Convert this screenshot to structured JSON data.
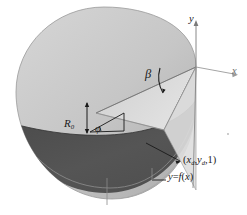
{
  "figure": {
    "background_color": "#ffffff",
    "surface_light_color": "#c9c9c9",
    "surface_mid_color": "#b4b4b4",
    "surface_dark_color": "#4d4d4d",
    "surface_edge_color": "#8a8a8a",
    "line_color": "#1a1a1a",
    "axis_color": "#7a7a7a"
  },
  "labels": {
    "beta": "β",
    "r_zero": "R",
    "r_zero_sub": "0",
    "phi": "φ",
    "axis_y": "y",
    "axis_x": "x",
    "point_open": "(",
    "point_x": "x",
    "point_x_sub": "d",
    "point_comma1": ",",
    "point_y": "y",
    "point_y_sub": "d",
    "point_comma2": ",",
    "point_z": "1",
    "point_close": ")",
    "curve_y": "y",
    "curve_eq": "=",
    "curve_f": "f",
    "curve_paren_open": "(",
    "curve_var": "x",
    "curve_paren_close": ")"
  },
  "annotations": {
    "angle_beta_description": "opening angle at cone apex",
    "radius_description": "vertical double-headed arrow marking R0",
    "angle_phi_description": "small angle at base of R0 arrow",
    "leader_point_description": "arrow leader pointing to point label",
    "leader_curve_description": "plain leader line to curve label"
  }
}
